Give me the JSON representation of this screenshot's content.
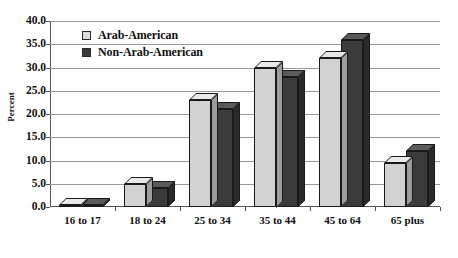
{
  "chart_data": {
    "type": "bar",
    "title": "",
    "xlabel": "",
    "ylabel": "Percent",
    "ylim": [
      0.0,
      40.0
    ],
    "ytick_step": 5.0,
    "ytick_labels": [
      "0.0",
      "5.0",
      "10.0",
      "15.0",
      "20.0",
      "25.0",
      "30.0",
      "35.0",
      "40.0"
    ],
    "ytick_values": [
      0.0,
      5.0,
      10.0,
      15.0,
      20.0,
      25.0,
      30.0,
      35.0,
      40.0
    ],
    "grid": true,
    "grid_axis": "y",
    "legend_position": "top-left-inside",
    "categories": [
      "16 to 17",
      "18 to 24",
      "25 to 34",
      "35 to 44",
      "45 to 64",
      "65 plus"
    ],
    "series": [
      {
        "name": "Arab-American",
        "color": "#d2d2d2",
        "values": [
          0.4,
          5.0,
          23.0,
          30.0,
          32.0,
          9.5
        ]
      },
      {
        "name": "Non-Arab-American",
        "color": "#3b3b3b",
        "values": [
          0.4,
          4.0,
          21.0,
          28.0,
          36.0,
          12.0
        ]
      }
    ]
  },
  "legend": {
    "items": [
      {
        "label": "Arab-American",
        "swatch": "light"
      },
      {
        "label": "Non-Arab-American",
        "swatch": "dark"
      }
    ]
  }
}
